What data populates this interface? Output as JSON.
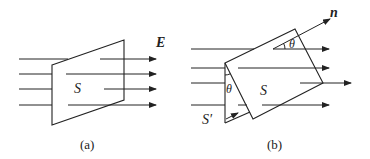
{
  "figure_a": {
    "caption": "(a)",
    "surface_label": "S",
    "field_label": "E"
  },
  "figure_b": {
    "caption": "(b)",
    "surface_label": "S",
    "projected_surface_label": "S′",
    "normal_label": "n",
    "angle_label_top": "θ",
    "angle_label_side": "θ"
  },
  "colors": {
    "stroke": "#222222",
    "background": "#ffffff"
  }
}
